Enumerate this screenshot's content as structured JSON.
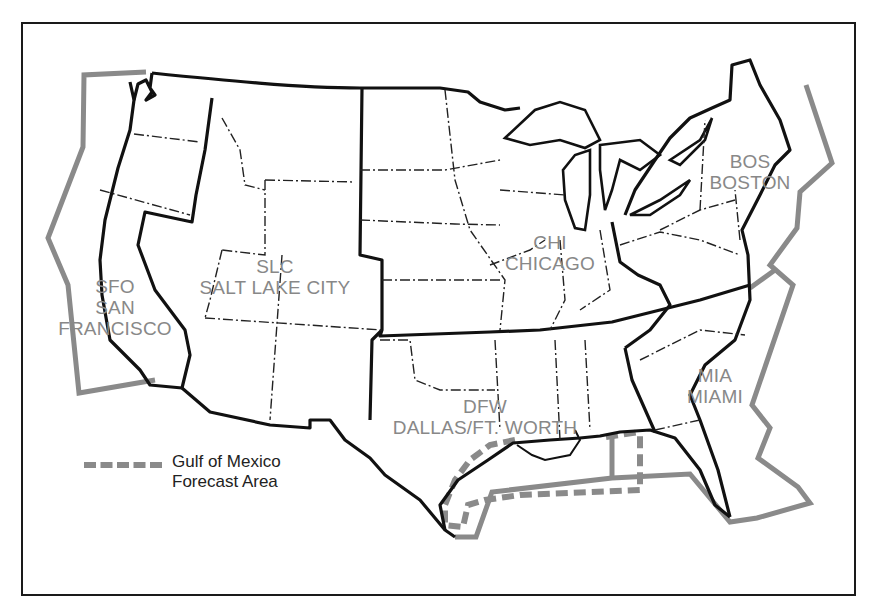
{
  "map": {
    "title": "",
    "colors": {
      "frame": "#1a1a1a",
      "state_border": "#111111",
      "area_boundary": "#8a8a8a",
      "label": "#888888"
    },
    "regions": [
      {
        "code": "SFO",
        "name": "SAN",
        "name2": "FRANCISCO"
      },
      {
        "code": "SLC",
        "name": "SALT LAKE CITY"
      },
      {
        "code": "CHI",
        "name": "CHICAGO"
      },
      {
        "code": "BOS",
        "name": "BOSTON"
      },
      {
        "code": "DFW",
        "name": "DALLAS/FT. WORTH"
      },
      {
        "code": "MIA",
        "name": "MIAMI"
      }
    ],
    "legend": {
      "line1": "Gulf of Mexico",
      "line2": "Forecast Area",
      "style": "dashed-gray"
    }
  }
}
